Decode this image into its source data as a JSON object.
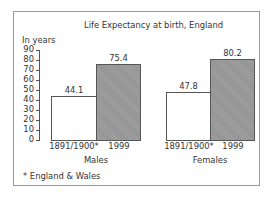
{
  "chart_data": {
    "type": "bar",
    "title": "Life Expectancy at birth, England",
    "ylabel": "In years",
    "xlabel": "",
    "ylim": [
      0,
      90
    ],
    "yticks": [
      0,
      10,
      20,
      30,
      40,
      50,
      60,
      70,
      80,
      90
    ],
    "grid": false,
    "legend": null,
    "groups": [
      "Males",
      "Females"
    ],
    "categories": [
      "1891/1900*",
      "1999"
    ],
    "series": [
      {
        "name": "1891/1900*",
        "color": "#ffffff",
        "values": [
          44.1,
          47.8
        ]
      },
      {
        "name": "1999",
        "color": "#999999",
        "values": [
          75.4,
          80.2
        ]
      }
    ],
    "footnote": "* England & Wales"
  },
  "labels": {
    "title": "Life Expectancy at birth, England",
    "unit": "In years",
    "ticks": [
      "90",
      "80",
      "70",
      "60",
      "50",
      "40",
      "30",
      "20",
      "10",
      "0"
    ],
    "males": {
      "group": "Males",
      "old_cat": "1891/1900*",
      "new_cat": "1999",
      "old_val": "44.1",
      "new_val": "75.4"
    },
    "females": {
      "group": "Females",
      "old_cat": "1891/1900*",
      "new_cat": "1999",
      "old_val": "47.8",
      "new_val": "80.2"
    },
    "footnote": "* England & Wales"
  }
}
